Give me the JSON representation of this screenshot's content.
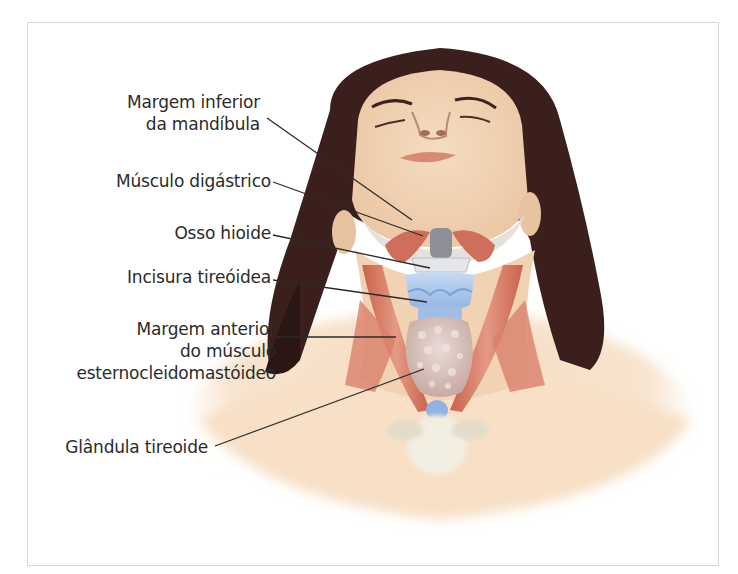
{
  "figure": {
    "labels": [
      {
        "id": "margem-inferior-mandibula",
        "lines": [
          "Margem inferior",
          "da mandíbula"
        ]
      },
      {
        "id": "musculo-digastrico",
        "lines": [
          "Músculo digástrico"
        ]
      },
      {
        "id": "osso-hioide",
        "lines": [
          "Osso hioide"
        ]
      },
      {
        "id": "incisura-tireoidea",
        "lines": [
          "Incisura tireóidea"
        ]
      },
      {
        "id": "margem-anterior-ecm",
        "lines": [
          "Margem anterior",
          "do músculo",
          "esternocleidomastóideo"
        ]
      },
      {
        "id": "glandula-tireoide",
        "lines": [
          "Glândula tireoide"
        ]
      }
    ]
  },
  "colors": {
    "skin": "#f3d6b6",
    "skin_shadow": "#e7bf98",
    "hair": "#3a1f1c",
    "muscle": "#d9745e",
    "cartilage": "#a9c6ea",
    "thyroid": "#d9c6c0",
    "leader_line": "#2b2b2b",
    "frame_border": "#d6d6d6"
  }
}
